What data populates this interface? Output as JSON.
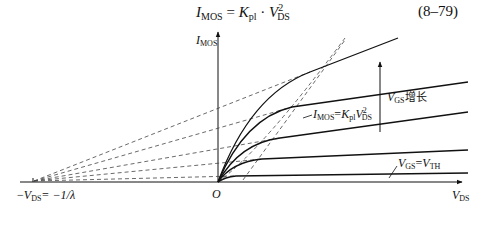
{
  "equation": {
    "lhs_symbol": "I",
    "lhs_sub": "MOS",
    "equals": " = ",
    "k_symbol": "K",
    "k_sub": "pl",
    "dot": " · ",
    "v_symbol": "V",
    "v_sub": "DS",
    "v_sup": "2",
    "number": "(8–79)"
  },
  "diagram": {
    "y_axis_label": {
      "symbol": "I",
      "sub": "MOS"
    },
    "x_axis_label": {
      "symbol": "V",
      "sub": "DS"
    },
    "origin_label": "O",
    "intercept_label": {
      "prefix": "−",
      "symbol": "V",
      "sub": "DS",
      "rest": "= −1/λ"
    },
    "boundary_label": {
      "symbol": "I",
      "sub": "MOS",
      "eq": "=",
      "k": "K",
      "k_sub": "pl",
      "v": "V",
      "v_sub": "DS",
      "v_sup": "2"
    },
    "increase_label": {
      "symbol": "V",
      "sub": "GS",
      "text": "增长"
    },
    "threshold_label": {
      "symbol": "V",
      "sub": "GS",
      "eq": "=",
      "v": "V",
      "v_sub": "TH"
    },
    "curves": [
      {
        "name": "curve-1-highest-vgs",
        "knee": [
          310,
          72
        ],
        "end": [
          398,
          38
        ]
      },
      {
        "name": "curve-2",
        "knee": [
          292,
          107
        ],
        "end": [
          468,
          82
        ]
      },
      {
        "name": "curve-3",
        "knee": [
          280,
          138
        ],
        "end": [
          468,
          112
        ]
      },
      {
        "name": "curve-4",
        "knee": [
          262,
          159
        ],
        "end": [
          468,
          150
        ]
      },
      {
        "name": "curve-5-vgs-eq-vth",
        "knee": [
          236,
          176
        ],
        "end": [
          468,
          173
        ]
      }
    ],
    "colors": {
      "line": "#111111",
      "dash": "#444444",
      "background": "#ffffff"
    }
  }
}
